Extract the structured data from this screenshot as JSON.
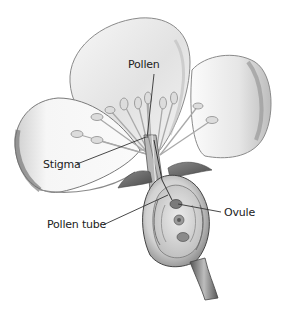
{
  "diagram": {
    "labels": {
      "pollen": "Pollen",
      "stigma": "Stigma",
      "pollen_tube": "Pollen tube",
      "ovule": "Ovule"
    },
    "colors": {
      "background": "#ffffff",
      "label_text": "#222222",
      "leader_line": "#333333",
      "petal_fill": "#f4f4f4",
      "petal_shadow": "#9a9a9a",
      "ovary_fill": "#d6d6d6",
      "ovary_dark": "#6a6a6a"
    }
  }
}
